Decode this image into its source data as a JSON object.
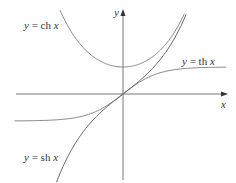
{
  "chart_data": {
    "type": "line",
    "title": "",
    "xlabel": "x",
    "ylabel": "y",
    "grid": false,
    "legend": "inline labels",
    "xlim": [
      -3.1,
      2.95
    ],
    "ylim": [
      -3.2,
      3.5
    ],
    "series": [
      {
        "name": "y = ch x",
        "function": "cosh(x)",
        "x_range": [
          -1.8,
          1.75
        ]
      },
      {
        "name": "y = th x",
        "function": "tanh(x)",
        "x_range": [
          -3.1,
          2.95
        ]
      },
      {
        "name": "y = sh x",
        "function": "sinh(x)",
        "x_range": [
          -1.9,
          1.8
        ]
      }
    ],
    "annotations": [
      {
        "text": "y = ch x",
        "position": "upper left"
      },
      {
        "text": "y = th x",
        "position": "right, above asymptote"
      },
      {
        "text": "y = sh x",
        "position": "lower left"
      }
    ]
  },
  "labels": {
    "ch": {
      "y": "y",
      "eq": " = ch ",
      "x": "x"
    },
    "th": {
      "y": "y",
      "eq": " = th ",
      "x": "x"
    },
    "sh": {
      "y": "y",
      "eq": " = sh ",
      "x": "x"
    },
    "x_axis": "x",
    "y_axis": "y"
  },
  "colors": {
    "curve": "#7a7a7a",
    "axis": "#555555",
    "text": "#333333"
  }
}
